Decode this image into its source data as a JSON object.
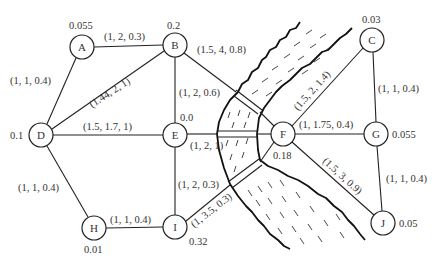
{
  "diagram": {
    "type": "network-graph-with-river",
    "nodes": [
      {
        "id": "A",
        "label": "A",
        "value": "0.055",
        "x": 82,
        "y": 47
      },
      {
        "id": "B",
        "label": "B",
        "value": "0.2",
        "x": 175,
        "y": 45
      },
      {
        "id": "C",
        "label": "C",
        "value": "0.03",
        "x": 372,
        "y": 40
      },
      {
        "id": "D",
        "label": "D",
        "value": "0.1",
        "x": 41,
        "y": 135
      },
      {
        "id": "E",
        "label": "E",
        "value": "0.0",
        "x": 175,
        "y": 135
      },
      {
        "id": "F",
        "label": "F",
        "value": "0.18",
        "x": 283,
        "y": 134
      },
      {
        "id": "G",
        "label": "G",
        "value": "0.055",
        "x": 376,
        "y": 134
      },
      {
        "id": "H",
        "label": "H",
        "value": "0.01",
        "x": 94,
        "y": 228
      },
      {
        "id": "I",
        "label": "I",
        "value": "0.32",
        "x": 175,
        "y": 227
      },
      {
        "id": "J",
        "label": "J",
        "value": "0.05",
        "x": 383,
        "y": 223
      }
    ],
    "edges": [
      {
        "from": "A",
        "to": "B",
        "label": "(1, 2, 0.3)"
      },
      {
        "from": "A",
        "to": "D",
        "label": "(1, 1, 0.4)"
      },
      {
        "from": "D",
        "to": "B",
        "label": "(1.44, 2, 1)"
      },
      {
        "from": "D",
        "to": "E",
        "label": "(1.5, 1.7, 1)"
      },
      {
        "from": "D",
        "to": "H",
        "label": "(1, 1, 0.4)"
      },
      {
        "from": "B",
        "to": "E",
        "label": "(1, 2, 0.6)"
      },
      {
        "from": "B",
        "to": "F",
        "label": "(1.5, 4, 0.8)"
      },
      {
        "from": "E",
        "to": "F",
        "label": "(1, 2, 1)"
      },
      {
        "from": "E",
        "to": "I",
        "label": "(1, 2, 0.3)"
      },
      {
        "from": "H",
        "to": "I",
        "label": "(1, 1, 0.4)"
      },
      {
        "from": "I",
        "to": "F",
        "label": "(1, 3.5, 0.3)"
      },
      {
        "from": "F",
        "to": "C",
        "label": "(1.5, 2, 1.4)"
      },
      {
        "from": "F",
        "to": "G",
        "label": "(1, 1.75, 0.4)"
      },
      {
        "from": "F",
        "to": "J",
        "label": "(1.5, 3, 0.9)"
      },
      {
        "from": "C",
        "to": "G",
        "label": "(1, 1, 0.4)"
      },
      {
        "from": "G",
        "to": "J",
        "label": "(1, 1, 0.4)"
      }
    ],
    "river": {
      "bridges": [
        "B-F",
        "E-F",
        "I-F"
      ]
    }
  }
}
